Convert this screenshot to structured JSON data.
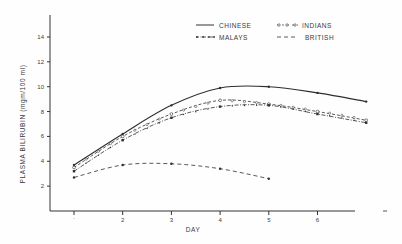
{
  "chart_data": {
    "type": "line",
    "title": "",
    "xlabel": "DAY",
    "ylabel": "PLASMA BILIRUBIN (mgm/100 ml)",
    "x": [
      1,
      2,
      3,
      4,
      5,
      6,
      7
    ],
    "x_tick_labels": [
      "1",
      "2",
      "3",
      "4",
      "5",
      "6"
    ],
    "y_tick_labels": [
      "2",
      "4",
      "6",
      "8",
      "10",
      "12",
      "14"
    ],
    "xlim": [
      0.5,
      7.2
    ],
    "ylim": [
      0,
      15.5
    ],
    "grid": false,
    "legend_position": "top-right",
    "series": [
      {
        "name": "CHINESE",
        "style": "solid",
        "marker": "dot",
        "x": [
          1,
          2,
          3,
          4,
          5,
          6,
          7
        ],
        "values": [
          3.7,
          6.2,
          8.5,
          9.9,
          10.0,
          9.5,
          8.8
        ]
      },
      {
        "name": "INDIANS",
        "style": "dash-circle",
        "marker": "open-circle",
        "x": [
          1,
          2,
          3,
          4,
          5,
          6,
          7
        ],
        "values": [
          3.5,
          6.0,
          7.8,
          8.9,
          8.6,
          8.0,
          7.3
        ]
      },
      {
        "name": "MALAYS",
        "style": "dash-dot",
        "marker": "cross",
        "x": [
          1,
          2,
          3,
          4,
          5,
          6,
          7
        ],
        "values": [
          3.2,
          5.7,
          7.5,
          8.4,
          8.5,
          7.8,
          7.1
        ]
      },
      {
        "name": "BRITISH",
        "style": "dashed",
        "marker": "dot",
        "x": [
          1,
          2,
          3,
          4,
          5
        ],
        "values": [
          2.7,
          3.7,
          3.8,
          3.4,
          2.6
        ]
      }
    ]
  },
  "legend": {
    "chinese": "CHINESE",
    "indians": "INDIANS",
    "malays": "MALAYS",
    "british": "BRITISH"
  },
  "axes": {
    "xlabel": "DAY",
    "ylabel": "PLASMA BILIRUBIN (mgm/100 ml)",
    "x_ticks": [
      "1",
      "2",
      "3",
      "4",
      "5",
      "6"
    ],
    "y_ticks": [
      "2",
      "4",
      "6",
      "8",
      "10",
      "12",
      "14"
    ]
  }
}
